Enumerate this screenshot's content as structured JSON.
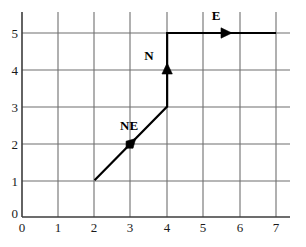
{
  "chart_data": {
    "type": "line",
    "title": "",
    "xlabel": "",
    "ylabel": "",
    "xlim": [
      0,
      7
    ],
    "ylim": [
      0,
      5
    ],
    "grid": true,
    "legend": "none",
    "x_ticks": [
      "0",
      "1",
      "2",
      "3",
      "4",
      "5",
      "6",
      "7"
    ],
    "y_ticks": [
      "0",
      "1",
      "2",
      "3",
      "4",
      "5"
    ],
    "x_tick_values": [
      0,
      1,
      2,
      3,
      4,
      5,
      6,
      7
    ],
    "y_tick_values": [
      0,
      1,
      2,
      3,
      4,
      5
    ],
    "series": [
      {
        "name": "path",
        "points": [
          [
            2,
            1
          ],
          [
            4,
            3
          ],
          [
            4,
            5
          ],
          [
            7,
            5
          ]
        ],
        "style": "solid",
        "color": "#000000",
        "width": 2.2
      }
    ],
    "annotations": [
      {
        "label": "NE",
        "label_x": 2.95,
        "label_y": 2.5,
        "marker_x": 3,
        "marker_y": 2,
        "marker": "arrowhead",
        "direction": "northeast"
      },
      {
        "label": "N",
        "label_x": 3.5,
        "label_y": 4.4,
        "marker_x": 4,
        "marker_y": 4,
        "marker": "arrowhead",
        "direction": "north"
      },
      {
        "label": "E",
        "label_x": 5.35,
        "label_y": 5.5,
        "marker_x": 5.6,
        "marker_y": 5,
        "marker": "arrowhead",
        "direction": "east"
      }
    ]
  },
  "colors": {
    "grid": "#6f6f6f",
    "axis": "#3d3d3d",
    "path": "#000000",
    "text": "#151515",
    "background": "#ffffff"
  },
  "axis_ticks": {
    "x": [
      {
        "label": "0",
        "px": 22
      },
      {
        "label": "1",
        "px": 58
      },
      {
        "label": "2",
        "px": 94
      },
      {
        "label": "3",
        "px": 130
      },
      {
        "label": "4",
        "px": 167
      },
      {
        "label": "5",
        "px": 203
      },
      {
        "label": "6",
        "px": 240
      },
      {
        "label": "7",
        "px": 276
      }
    ],
    "y": [
      {
        "label": "0",
        "px": 217
      },
      {
        "label": "1",
        "px": 181
      },
      {
        "label": "2",
        "px": 144
      },
      {
        "label": "3",
        "px": 107
      },
      {
        "label": "4",
        "px": 70
      },
      {
        "label": "5",
        "px": 33
      }
    ]
  }
}
